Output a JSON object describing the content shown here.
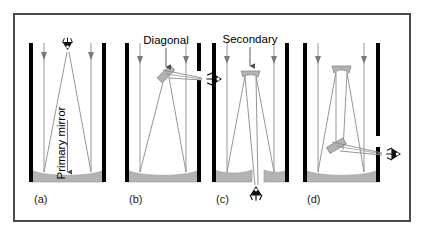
{
  "figure": {
    "border_color": "#4a4a4a",
    "background_color": "#ffffff"
  },
  "colors": {
    "tube_wall": "#000000",
    "mirror_fill": "#b3b3b3",
    "mirror_stroke": "#8c8c8c",
    "ray": "#8a8a8a",
    "incoming_ray": "#8a8a8a",
    "text": "#1a1a1a",
    "eye_symbol": "#111111"
  },
  "labels": {
    "primary_mirror": "Primary mirror",
    "diagonal": "Diagonal",
    "secondary": "Secondary"
  },
  "panels": [
    {
      "id": "a",
      "caption": "(a)",
      "name": "prime-focus",
      "label": "Primary mirror",
      "label_rotated": true,
      "eye_position": "top-center-inside-tube",
      "has_secondary": false,
      "has_diagonal": false
    },
    {
      "id": "b",
      "caption": "(b)",
      "name": "newtonian-focus",
      "label": "Diagonal",
      "label_rotated": false,
      "eye_position": "right-side-upper",
      "has_secondary": false,
      "has_diagonal": true
    },
    {
      "id": "c",
      "caption": "(c)",
      "name": "cassegrain-focus",
      "label": "Secondary",
      "label_rotated": false,
      "eye_position": "bottom-center-below-primary",
      "has_secondary": true,
      "has_diagonal": false
    },
    {
      "id": "d",
      "caption": "(d)",
      "name": "coude-nasmyth-focus",
      "label": "",
      "label_rotated": false,
      "eye_position": "right-side-lower",
      "has_secondary": true,
      "has_diagonal": true
    }
  ]
}
